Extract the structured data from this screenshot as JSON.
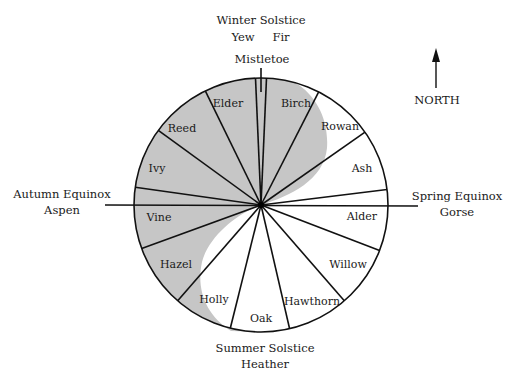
{
  "diagram": {
    "center": {
      "x": 261,
      "y": 205
    },
    "radius": 127,
    "colors": {
      "shade": "#c6c6c6",
      "line": "#111111",
      "background": "#ffffff"
    },
    "markers": {
      "top": {
        "line1": "Winter Solstice",
        "line2a": "Yew",
        "line2b": "Fir",
        "sub": "Mistletoe"
      },
      "bottom": {
        "line1": "Summer Solstice",
        "line2": "Heather"
      },
      "left": {
        "line1": "Autumn Equinox",
        "line2": "Aspen"
      },
      "right": {
        "line1": "Spring Equinox",
        "line2": "Gorse"
      },
      "north": {
        "label": "NORTH"
      }
    },
    "segments": [
      {
        "name": "Birch",
        "x": 296,
        "y": 107
      },
      {
        "name": "Rowan",
        "x": 340,
        "y": 130
      },
      {
        "name": "Ash",
        "x": 362,
        "y": 172
      },
      {
        "name": "Alder",
        "x": 362,
        "y": 220
      },
      {
        "name": "Willow",
        "x": 348,
        "y": 268
      },
      {
        "name": "Hawthorn",
        "x": 312,
        "y": 305
      },
      {
        "name": "Oak",
        "x": 261,
        "y": 322
      },
      {
        "name": "Holly",
        "x": 214,
        "y": 303
      },
      {
        "name": "Hazel",
        "x": 176,
        "y": 268
      },
      {
        "name": "Vine",
        "x": 159,
        "y": 221
      },
      {
        "name": "Ivy",
        "x": 157,
        "y": 172
      },
      {
        "name": "Reed",
        "x": 182,
        "y": 132
      },
      {
        "name": "Elder",
        "x": 228,
        "y": 107
      }
    ],
    "boundary_angles_deg": [
      -2.5,
      2.5,
      27,
      55,
      83,
      111,
      139,
      167,
      194,
      221,
      250,
      278,
      306,
      334
    ]
  }
}
